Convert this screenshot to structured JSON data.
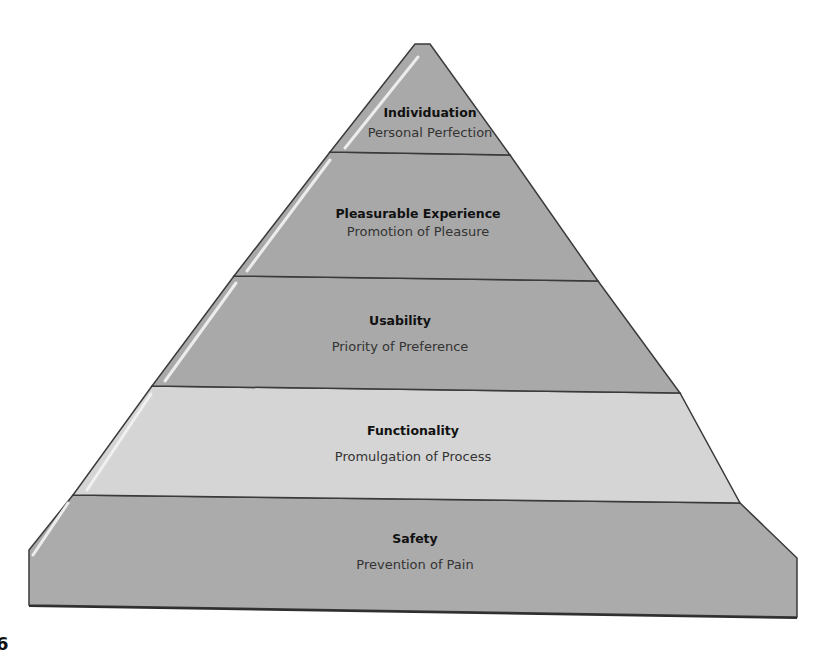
{
  "diagram": {
    "type": "pyramid",
    "levels": [
      {
        "title": "Individuation",
        "subtitle": "Personal Perfection",
        "fill": "#a9a9a9"
      },
      {
        "title": "Pleasurable Experience",
        "subtitle": "Promotion of Pleasure",
        "fill": "#a8a8a8"
      },
      {
        "title": "Usability",
        "subtitle": "Priority of Preference",
        "fill": "#a9a9a9"
      },
      {
        "title": "Functionality",
        "subtitle": "Promulgation of Process",
        "fill": "#d5d5d5"
      },
      {
        "title": "Safety",
        "subtitle": "Prevention of Pain",
        "fill": "#ababab"
      }
    ],
    "stray_char": "6",
    "colors": {
      "outline": "#3a3a3a",
      "highlight": "#f2f2f2"
    }
  }
}
